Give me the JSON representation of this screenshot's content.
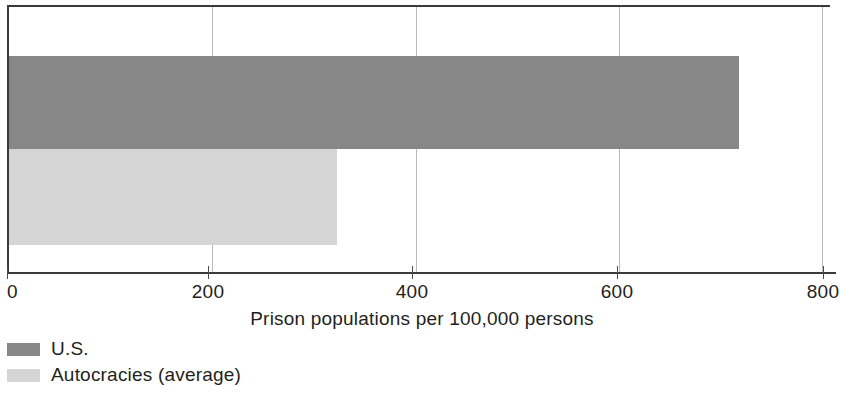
{
  "chart_data": {
    "type": "bar",
    "orientation": "horizontal",
    "title": "",
    "xlabel": "Prison populations per 100,000 persons",
    "ylabel": "",
    "xlim": [
      0,
      800
    ],
    "xticks": [
      "0",
      "200",
      "400",
      "600",
      "800"
    ],
    "xtick_values": [
      0,
      200,
      400,
      600,
      800
    ],
    "grid": "vertical",
    "legend_position": "below-axis-left",
    "categories": [
      "U.S.",
      "Autocracies (average)"
    ],
    "values": [
      718,
      323
    ],
    "series": [
      {
        "name": "U.S.",
        "value": 718,
        "color": "#878787"
      },
      {
        "name": "Autocracies (average)",
        "value": 323,
        "color": "#d5d5d5"
      }
    ],
    "legend": [
      {
        "label": "U.S.",
        "color": "#878787"
      },
      {
        "label": "Autocracies (average)",
        "color": "#d5d5d5"
      }
    ]
  },
  "axis": {
    "title": "Prison populations per 100,000 persons",
    "tick_0": "0",
    "tick_200": "200",
    "tick_400": "400",
    "tick_600": "600",
    "tick_800": "800"
  },
  "legend": {
    "item_us_label": "U.S.",
    "item_autocracies_label": "Autocracies (average)"
  },
  "colors": {
    "bar_us": "#878787",
    "bar_autocracies": "#d5d5d5",
    "axis": "#3a3a3a",
    "gridline": "#b9b9b9",
    "text": "#231f20",
    "background": "#ffffff"
  }
}
